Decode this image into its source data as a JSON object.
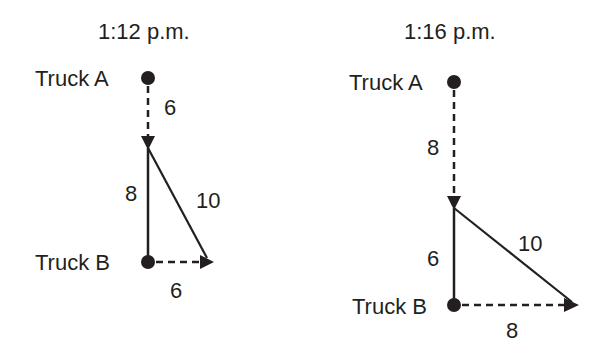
{
  "panels": [
    {
      "time": "1:12 p.m.",
      "truck_a_label": "Truck A",
      "truck_b_label": "Truck B",
      "truck_a_distance": "6",
      "separation_vertical": "8",
      "separation_direct": "10",
      "truck_b_distance": "6"
    },
    {
      "time": "1:16 p.m.",
      "truck_a_label": "Truck A",
      "truck_b_label": "Truck B",
      "truck_a_distance": "8",
      "separation_vertical": "6",
      "separation_direct": "10",
      "truck_b_distance": "8"
    }
  ],
  "colors": {
    "ink": "#231f20",
    "background": "#ffffff"
  }
}
